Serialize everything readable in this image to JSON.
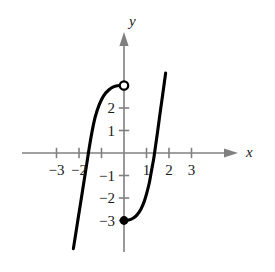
{
  "figure": {
    "title": "",
    "background_color": "#ffffff",
    "curve_color": "#000000",
    "axis_color": "#808080",
    "label_color": "#1a1a1a"
  },
  "axes": {
    "x_axis_label": "x",
    "y_axis_label": "y",
    "x_arrow": "arrow-right",
    "y_arrow": "arrow-up",
    "origin_px": {
      "x": 124,
      "y": 153
    },
    "unit_px": 22.5,
    "x_ticks": [
      {
        "value": -3,
        "label": "−3"
      },
      {
        "value": -2,
        "label": "−2"
      },
      {
        "value": -1,
        "label": ""
      },
      {
        "value": 1,
        "label": "1"
      },
      {
        "value": 2,
        "label": "2"
      },
      {
        "value": 3,
        "label": "3"
      }
    ],
    "y_ticks": [
      {
        "value": 3,
        "label": ""
      },
      {
        "value": 2,
        "label": "2"
      },
      {
        "value": 1,
        "label": "1"
      },
      {
        "value": -1,
        "label": "−1"
      },
      {
        "value": -2,
        "label": "−2"
      },
      {
        "value": -3,
        "label": "−3"
      }
    ]
  },
  "chart_data": {
    "type": "line",
    "title": "",
    "xlabel": "x",
    "ylabel": "y",
    "xlim": [
      -3.8,
      3.8
    ],
    "ylim": [
      -4.4,
      4.0
    ],
    "grid": false,
    "legend": "none",
    "series": [
      {
        "name": "left-branch",
        "description": "Increasing curve rising from lower left, crossing the x-axis near x = -1.6, flattening to an open endpoint at (0, 3).",
        "points": [
          [
            -2.25,
            -4.25
          ],
          [
            -2.1,
            -3.3
          ],
          [
            -1.95,
            -2.35
          ],
          [
            -1.8,
            -1.4
          ],
          [
            -1.65,
            -0.45
          ],
          [
            -1.55,
            0.2
          ],
          [
            -1.42,
            0.95
          ],
          [
            -1.28,
            1.6
          ],
          [
            -1.1,
            2.15
          ],
          [
            -0.9,
            2.55
          ],
          [
            -0.68,
            2.8
          ],
          [
            -0.45,
            2.95
          ],
          [
            -0.22,
            3.0
          ],
          [
            0,
            3.0
          ]
        ],
        "endpoint_open": {
          "x": 0,
          "y": 3
        },
        "endpoint_filled": null
      },
      {
        "name": "right-branch",
        "description": "Increasing curve starting at the closed endpoint (0, -3), rising slowly then steeply, crossing the x-axis near x = 1.45 and continuing up past y = 3.5.",
        "points": [
          [
            0,
            -3.0
          ],
          [
            0.2,
            -2.98
          ],
          [
            0.4,
            -2.9
          ],
          [
            0.58,
            -2.75
          ],
          [
            0.75,
            -2.5
          ],
          [
            0.9,
            -2.15
          ],
          [
            1.02,
            -1.75
          ],
          [
            1.13,
            -1.3
          ],
          [
            1.22,
            -0.8
          ],
          [
            1.32,
            -0.25
          ],
          [
            1.4,
            0.3
          ],
          [
            1.5,
            1.0
          ],
          [
            1.6,
            1.75
          ],
          [
            1.72,
            2.6
          ],
          [
            1.85,
            3.55
          ]
        ],
        "endpoint_open": null,
        "endpoint_filled": {
          "x": 0,
          "y": -3
        }
      }
    ],
    "markers": [
      {
        "type": "open-circle",
        "x": 0,
        "y": 3,
        "meaning": "excluded-endpoint"
      },
      {
        "type": "filled-circle",
        "x": 0,
        "y": -3,
        "meaning": "included-endpoint"
      }
    ]
  }
}
